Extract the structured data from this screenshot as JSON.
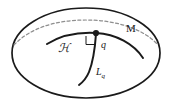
{
  "figure": {
    "type": "geometry-diagram",
    "background_color": "#ffffff",
    "stroke_color": "#1a1a1a",
    "dashed_color": "#8f8f8f",
    "width": 172,
    "height": 107,
    "labels": {
      "manifold": "M",
      "hypersurface": "ℋ",
      "point": "q",
      "line_base": "L",
      "line_subscript": "q"
    },
    "elements": {
      "outer_ellipse": {
        "name": "manifold-boundary",
        "cx": 86,
        "cy": 53,
        "rx": 75,
        "ry": 45
      },
      "dashed_curve": {
        "name": "dashed-horizon-curve",
        "dasharray": "3 2.4"
      },
      "point_marker": {
        "name": "point-q",
        "cx": 96,
        "cy": 33,
        "r": 3.1
      },
      "right_angle": {
        "name": "right-angle-marker",
        "size": 8
      }
    }
  }
}
